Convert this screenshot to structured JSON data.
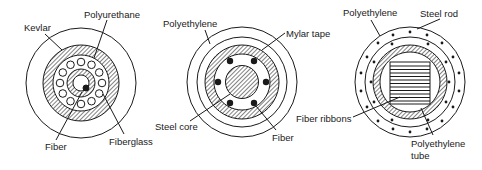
{
  "figure": {
    "colors": {
      "stroke": "#1a1a1a",
      "background": "#ffffff"
    }
  },
  "cables": [
    {
      "id": "cable-1",
      "labels": {
        "kevlar": "Kevlar",
        "polyurethane": "Polyurethane",
        "fiber": "Fiber",
        "fiberglass": "Fiberglass"
      }
    },
    {
      "id": "cable-2",
      "labels": {
        "polyethylene": "Polyethylene",
        "mylar_tape": "Mylar tape",
        "steel_core": "Steel core",
        "fiber": "Fiber"
      }
    },
    {
      "id": "cable-3",
      "labels": {
        "polyethylene": "Polyethylene",
        "steel_rod": "Steel rod",
        "fiber_ribbons": "Fiber ribbons",
        "polyethylene_tube_line1": "Polyethylene",
        "polyethylene_tube_line2": "tube"
      }
    }
  ]
}
